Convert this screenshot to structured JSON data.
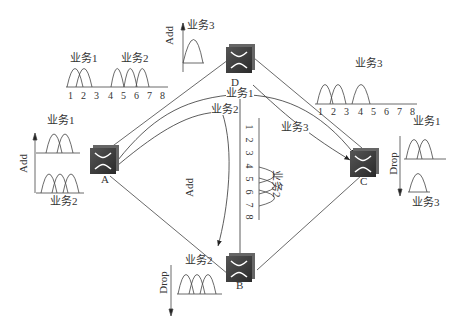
{
  "nodes": {
    "A": {
      "label": "A"
    },
    "B": {
      "label": "B"
    },
    "C": {
      "label": "C"
    },
    "D": {
      "label": "D"
    }
  },
  "services": {
    "s1": "业务1",
    "s2": "业务2",
    "s3": "业务3"
  },
  "ops": {
    "add": "Add",
    "drop": "Drop"
  },
  "top_spectrum": {
    "ticks": [
      "1",
      "2",
      "3",
      "4",
      "5",
      "6",
      "7",
      "8"
    ],
    "left_label": "业务1",
    "right_label": "业务2"
  },
  "right_spectrum": {
    "ticks": [
      "1",
      "2",
      "3",
      "4",
      "5",
      "6",
      "7",
      "8"
    ],
    "label": "业务3"
  },
  "center_spectrum": {
    "ticks": [
      "1",
      "2",
      "3",
      "4",
      "5",
      "6",
      "7",
      "8"
    ],
    "label": "业务2"
  },
  "node_A": {
    "add_label": "Add",
    "top_service": "业务1",
    "bottom_service": "业务2"
  },
  "node_D": {
    "add_label": "Add",
    "service": "业务3"
  },
  "node_C": {
    "drop_label": "Drop",
    "top_service": "业务1",
    "bottom_service": "业务3"
  },
  "node_B": {
    "drop_label": "Drop",
    "service": "业务2"
  },
  "path_labels": {
    "p1": "业务1",
    "p2": "业务2",
    "p3": "业务3",
    "mid_add": "Add"
  }
}
